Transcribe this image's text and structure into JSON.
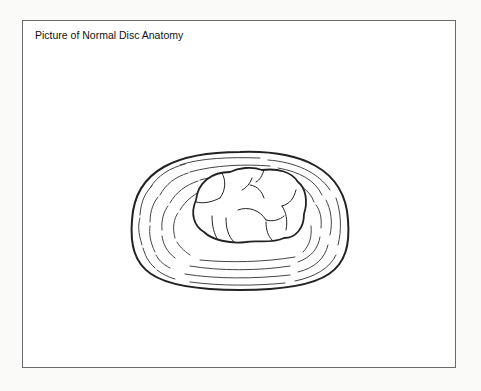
{
  "figure": {
    "title": "Picture of Normal Disc Anatomy",
    "parts": [
      "annulus-fibrosus",
      "nucleus-pulposus"
    ]
  }
}
